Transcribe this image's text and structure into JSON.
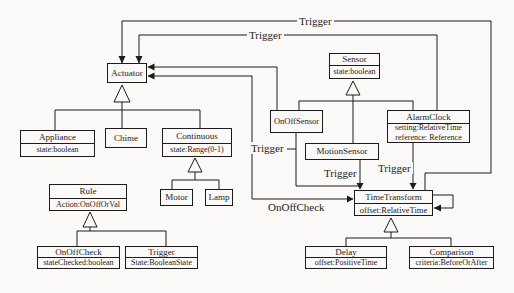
{
  "classes": {
    "actuator": {
      "name": "Actuator",
      "attrs": []
    },
    "sensor": {
      "name": "Sensor",
      "attrs": [
        "state:boolean"
      ]
    },
    "appliance": {
      "name": "Appliance",
      "attrs": [
        "state:boolean"
      ]
    },
    "chime": {
      "name": "Chime",
      "attrs": []
    },
    "continuous": {
      "name": "Continuous",
      "attrs": [
        "state:Range(0-1)"
      ]
    },
    "rule": {
      "name": "Rule",
      "attrs": [
        "Action:OnOffOrVal"
      ]
    },
    "motor": {
      "name": "Motor",
      "attrs": []
    },
    "lamp": {
      "name": "Lamp",
      "attrs": []
    },
    "onoffcheck": {
      "name": "OnOffCheck",
      "attrs": [
        "stateChecked:boolean"
      ]
    },
    "trigger": {
      "name": "Trigger",
      "attrs": [
        "State:BooleanState"
      ]
    },
    "onoffsensor": {
      "name": "OnOffSensor",
      "attrs": []
    },
    "motionsensor": {
      "name": "MotionSensor",
      "attrs": []
    },
    "alarmclock": {
      "name": "AlarmClock",
      "attrs": [
        "setting:RelativeTime",
        "reference: Reference"
      ]
    },
    "timetransform": {
      "name": "TimeTransform",
      "attrs": [
        "offset:RelativeTime"
      ]
    },
    "delay": {
      "name": "Delay",
      "attrs": [
        "offset:PositiveTime"
      ]
    },
    "comparison": {
      "name": "Comparison",
      "attrs": [
        "criteria:BeforeOrAfter"
      ]
    }
  },
  "edge_labels": {
    "trigger_top": "Trigger",
    "trigger_actuator_alarmclock": "Trigger",
    "trigger_onoffsensor": "Trigger",
    "trigger_motionsensor": "Trigger",
    "trigger_alarmclock": "Trigger",
    "onoffcheck_link": "OnOffCheck"
  },
  "colors": {
    "line": "#1c1c1c",
    "background": "#fbfaf8"
  }
}
